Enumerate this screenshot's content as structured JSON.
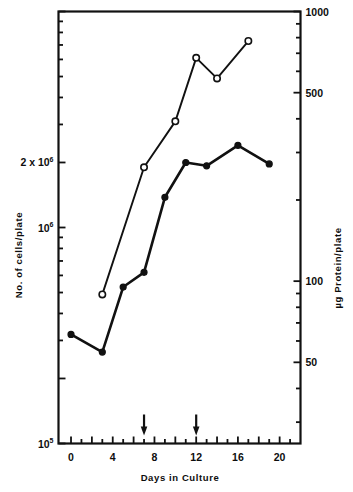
{
  "chart_data": {
    "type": "line",
    "title": "",
    "subtitle": "",
    "xlabel": "Days in Culture",
    "ylabel": "No. of cells/plate",
    "y2label": "µg Protein/plate",
    "xlim": [
      -1.2,
      22
    ],
    "x_ticks": [
      0,
      2,
      4,
      6,
      8,
      10,
      12,
      14,
      16,
      18,
      20
    ],
    "x_tick_labels": [
      "0",
      "",
      "4",
      "",
      "8",
      "",
      "12",
      "",
      "16",
      "",
      "20"
    ],
    "y_scale": "log",
    "ylim": [
      100000,
      10000000
    ],
    "y_tick_labels": [
      "2 x 10",
      "10",
      "10"
    ],
    "y_tick_exponents": [
      "6",
      "6",
      "5"
    ],
    "y_tick_values": [
      2000000,
      1000000,
      100000
    ],
    "y2_scale": "log",
    "y2lim": [
      25,
      1000
    ],
    "y2_ticks": [
      1000,
      500,
      100,
      50
    ],
    "y2_tick_labels": [
      "1000",
      "500",
      "100",
      "50"
    ],
    "grid": false,
    "legend": "none",
    "series": [
      {
        "name": "No. of cells/plate",
        "marker": "open-circle",
        "axis": "left",
        "points": [
          {
            "x": 3,
            "y": 490000
          },
          {
            "x": 7,
            "y": 1900000
          },
          {
            "x": 10,
            "y": 3100000
          },
          {
            "x": 12,
            "y": 6100000
          },
          {
            "x": 14,
            "y": 4900000
          },
          {
            "x": 17,
            "y": 7300000
          }
        ]
      },
      {
        "name": "µg Protein/plate",
        "marker": "filled-circle",
        "axis": "right",
        "points": [
          {
            "x": 0,
            "y": 320000
          },
          {
            "x": 3,
            "y": 265000
          },
          {
            "x": 5,
            "y": 530000
          },
          {
            "x": 7,
            "y": 620000
          },
          {
            "x": 9,
            "y": 1380000
          },
          {
            "x": 11,
            "y": 2000000
          },
          {
            "x": 13,
            "y": 1930000
          },
          {
            "x": 16,
            "y": 2400000
          },
          {
            "x": 19,
            "y": 1970000
          }
        ]
      }
    ],
    "annotations": [
      {
        "type": "arrow-down",
        "x": 7,
        "label": ""
      },
      {
        "type": "arrow-down",
        "x": 12,
        "label": ""
      }
    ],
    "colors": {
      "line": "#111111",
      "axis": "#111111",
      "background": "#ffffff"
    }
  }
}
